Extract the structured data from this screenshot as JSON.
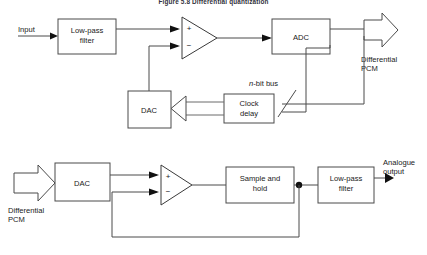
{
  "figure": {
    "title": "Figure 5.8   Differential quantization",
    "stroke_color": "#4a4a4a",
    "fill_color": "#ffffff",
    "text_color": "#1a1a1a"
  },
  "encoder": {
    "input_label": "Input",
    "lowpass_line1": "Low-pass",
    "lowpass_line2": "filter",
    "plus_sign": "+",
    "minus_sign": "−",
    "adc_label": "ADC",
    "output_line1": "Differential",
    "output_line2": "PCM",
    "dac_label": "DAC",
    "clock_line1": "Clock",
    "clock_line2": "delay",
    "bus_italic": "n",
    "bus_rest": "-bit bus"
  },
  "decoder": {
    "input_line1": "Differential",
    "input_line2": "PCM",
    "dac_label": "DAC",
    "plus_sign": "+",
    "minus_sign": "−",
    "sample_line1": "Sample and",
    "sample_line2": "hold",
    "lowpass_line1": "Low-pass",
    "lowpass_line2": "filter",
    "output_line1": "Analogue",
    "output_line2": "output"
  }
}
